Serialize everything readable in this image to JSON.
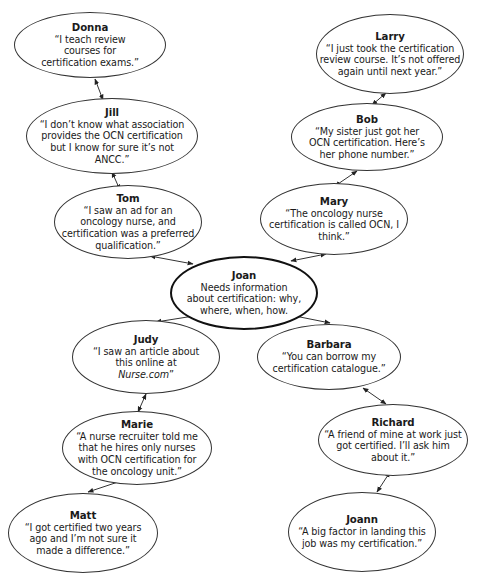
{
  "diagram": {
    "type": "network",
    "center": {
      "id": "joan",
      "name": "Joan",
      "text": "Needs information about certification: why, where, when, how."
    },
    "nodes": [
      {
        "id": "donna",
        "name": "Donna",
        "quote": "“I teach review courses for certification exams.”"
      },
      {
        "id": "jill",
        "name": "Jill",
        "quote": "“I don’t know what association provides the OCN certification but I know for sure it’s not ANCC.”"
      },
      {
        "id": "tom",
        "name": "Tom",
        "quote": "“I saw an ad for an oncology nurse, and certification was a preferred qualification.”"
      },
      {
        "id": "larry",
        "name": "Larry",
        "quote": "“I just took the certification review course. It’s not offered again until next year.”"
      },
      {
        "id": "bob",
        "name": "Bob",
        "quote": "“My sister just got her OCN certification. Here’s her phone number.”"
      },
      {
        "id": "mary",
        "name": "Mary",
        "quote": "“The oncology nurse certification is called OCN, I think.”"
      },
      {
        "id": "judy",
        "name": "Judy",
        "quote_pre": "“I saw an article about this online at ",
        "quote_em": "Nurse.com",
        "quote_post": "”"
      },
      {
        "id": "barbara",
        "name": "Barbara",
        "quote": "“You can borrow my certification catalogue.”"
      },
      {
        "id": "marie",
        "name": "Marie",
        "quote": "“A nurse recruiter told me that he hires only nurses with OCN certification for the oncology unit.”"
      },
      {
        "id": "richard",
        "name": "Richard",
        "quote": "“A friend of mine at work just got certified. I’ll ask him about it.”"
      },
      {
        "id": "matt",
        "name": "Matt",
        "quote": "“I got certified two years ago and I’m not sure it made a difference.”"
      },
      {
        "id": "joann",
        "name": "Joann",
        "quote": "“A big factor in landing this job was my certification.”"
      }
    ],
    "edges": [
      {
        "from": "donna",
        "to": "jill",
        "arrows": "both"
      },
      {
        "from": "jill",
        "to": "tom",
        "arrows": "both"
      },
      {
        "from": "tom",
        "to": "joan",
        "arrows": "both"
      },
      {
        "from": "larry",
        "to": "bob",
        "arrows": "both"
      },
      {
        "from": "bob",
        "to": "mary",
        "arrows": "both"
      },
      {
        "from": "mary",
        "to": "joan",
        "arrows": "both"
      },
      {
        "from": "joan",
        "to": "judy",
        "arrows": "both"
      },
      {
        "from": "joan",
        "to": "barbara",
        "arrows": "both"
      },
      {
        "from": "judy",
        "to": "marie",
        "arrows": "both"
      },
      {
        "from": "marie",
        "to": "matt",
        "arrows": "both"
      },
      {
        "from": "barbara",
        "to": "richard",
        "arrows": "both"
      },
      {
        "from": "richard",
        "to": "joann",
        "arrows": "both"
      }
    ]
  }
}
